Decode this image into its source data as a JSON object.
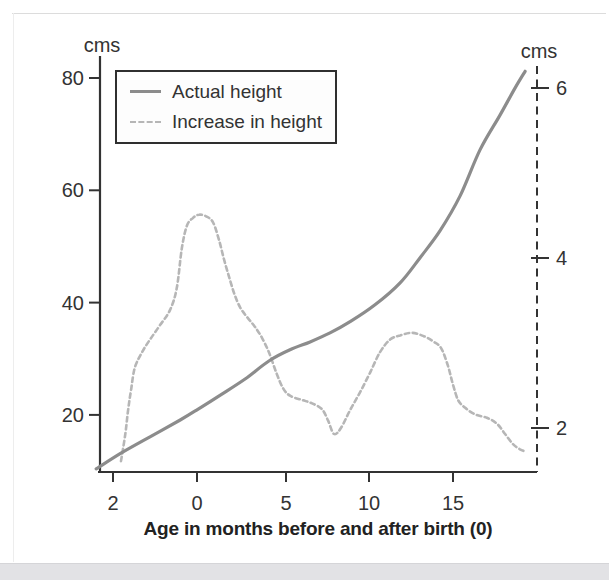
{
  "figure": {
    "left_axis_unit": "cms",
    "right_axis_unit": "cms",
    "x_axis_title": "Age in months before and after birth (0)",
    "colors": {
      "axis": "#333333",
      "text": "#333333",
      "actual_height_curve": "#8c8c8c",
      "increase_curve": "#b6b6b6",
      "bottom_strip": "#e2e2e5"
    }
  },
  "chart_data": {
    "type": "line",
    "title": "",
    "xlabel": "Age in months before and after birth (0)",
    "x_ticks": [
      {
        "label": "2",
        "month": -2
      },
      {
        "label": "0",
        "month": 0
      },
      {
        "label": "5",
        "month": 5
      },
      {
        "label": "10",
        "month": 10
      },
      {
        "label": "15",
        "month": 15
      }
    ],
    "left_axis": {
      "unit": "cms",
      "ticks": [
        20,
        40,
        60,
        80
      ],
      "range": [
        10,
        83
      ]
    },
    "right_axis": {
      "unit": "cms",
      "ticks": [
        2,
        4,
        6
      ],
      "range": [
        1.5,
        6.3
      ]
    },
    "legend_position": "top-left",
    "series": [
      {
        "name": "Actual height",
        "axis": "left",
        "style": "solid",
        "color": "#8c8c8c",
        "points": [
          [
            -2.4,
            10.4
          ],
          [
            -1.83,
            13.1
          ],
          [
            -1.12,
            16.1
          ],
          [
            -0.4,
            19.1
          ],
          [
            0.0,
            20.9
          ],
          [
            1.4,
            23.7
          ],
          [
            2.7,
            26.4
          ],
          [
            4.04,
            29.6
          ],
          [
            5.24,
            31.6
          ],
          [
            6.45,
            33.0
          ],
          [
            7.65,
            34.6
          ],
          [
            8.86,
            36.6
          ],
          [
            10.36,
            39.6
          ],
          [
            11.85,
            43.5
          ],
          [
            13.04,
            48.0
          ],
          [
            14.23,
            52.8
          ],
          [
            15.42,
            59.0
          ],
          [
            16.61,
            67.2
          ],
          [
            17.8,
            73.4
          ],
          [
            18.69,
            78.2
          ],
          [
            19.29,
            81.2
          ]
        ]
      },
      {
        "name": "Increase in height",
        "axis": "right",
        "style": "dashed",
        "color": "#b6b6b6",
        "points": [
          [
            -1.81,
            1.61
          ],
          [
            -1.71,
            1.92
          ],
          [
            -1.64,
            2.21
          ],
          [
            -1.57,
            2.45
          ],
          [
            -1.48,
            2.71
          ],
          [
            -1.31,
            2.89
          ],
          [
            -1.12,
            3.04
          ],
          [
            -0.88,
            3.21
          ],
          [
            -0.64,
            3.39
          ],
          [
            -0.48,
            3.65
          ],
          [
            -0.36,
            4.12
          ],
          [
            -0.24,
            4.38
          ],
          [
            -0.1,
            4.47
          ],
          [
            0.11,
            4.51
          ],
          [
            0.51,
            4.49
          ],
          [
            0.9,
            4.42
          ],
          [
            1.24,
            4.21
          ],
          [
            1.52,
            3.98
          ],
          [
            1.8,
            3.78
          ],
          [
            2.08,
            3.59
          ],
          [
            2.42,
            3.42
          ],
          [
            2.87,
            3.29
          ],
          [
            3.26,
            3.19
          ],
          [
            3.65,
            3.06
          ],
          [
            4.04,
            2.89
          ],
          [
            4.44,
            2.66
          ],
          [
            4.83,
            2.47
          ],
          [
            5.24,
            2.38
          ],
          [
            5.96,
            2.33
          ],
          [
            6.57,
            2.29
          ],
          [
            7.17,
            2.22
          ],
          [
            7.53,
            2.09
          ],
          [
            7.89,
            1.93
          ],
          [
            8.31,
            2.0
          ],
          [
            8.86,
            2.21
          ],
          [
            9.46,
            2.42
          ],
          [
            10.06,
            2.65
          ],
          [
            10.65,
            2.89
          ],
          [
            11.25,
            3.04
          ],
          [
            11.85,
            3.09
          ],
          [
            12.56,
            3.12
          ],
          [
            13.27,
            3.08
          ],
          [
            13.81,
            3.02
          ],
          [
            14.29,
            2.94
          ],
          [
            14.7,
            2.73
          ],
          [
            15.0,
            2.51
          ],
          [
            15.3,
            2.33
          ],
          [
            15.71,
            2.24
          ],
          [
            16.31,
            2.16
          ],
          [
            17.02,
            2.12
          ],
          [
            17.62,
            2.05
          ],
          [
            18.1,
            1.93
          ],
          [
            18.57,
            1.81
          ],
          [
            18.99,
            1.75
          ],
          [
            19.35,
            1.72
          ]
        ]
      }
    ]
  }
}
